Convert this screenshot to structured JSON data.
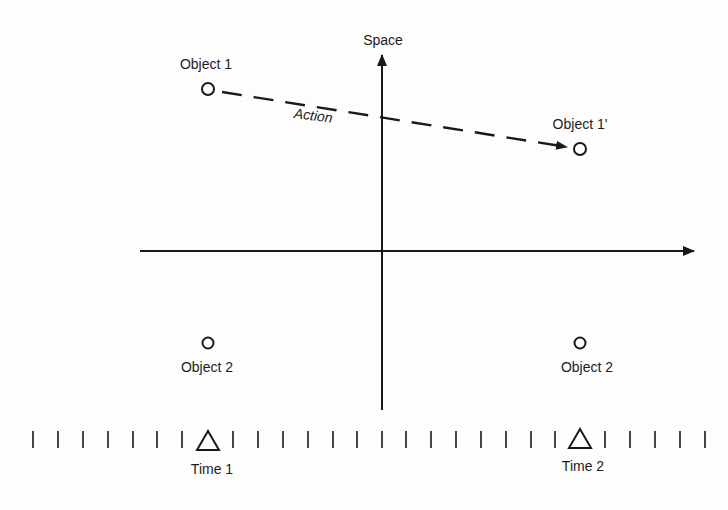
{
  "diagram": {
    "type": "space-time action diagram",
    "axes": {
      "vertical_label": "Space",
      "horizontal_label": ""
    },
    "objects": [
      {
        "id": "obj1-t1",
        "label": "Object 1",
        "time": "Time 1",
        "position": "upper-left",
        "x": 208,
        "y": 89
      },
      {
        "id": "obj1-t2",
        "label": "Object 1'",
        "time": "Time 2",
        "position": "upper-right",
        "x": 580,
        "y": 149
      },
      {
        "id": "obj2-t1",
        "label": "Object 2",
        "time": "Time 1",
        "position": "lower-left",
        "x": 208,
        "y": 343
      },
      {
        "id": "obj2-t2",
        "label": "Object 2",
        "time": "Time 2",
        "position": "lower-right",
        "x": 580,
        "y": 343
      }
    ],
    "action": {
      "label": "Action",
      "from": "Object 1",
      "to": "Object 1'",
      "style": "dashed-arrow"
    },
    "timeline": {
      "ticks_count": 27,
      "markers": [
        {
          "label": "Time 1",
          "symbol": "triangle",
          "x": 208
        },
        {
          "label": "Time 2",
          "symbol": "triangle",
          "x": 580
        }
      ]
    }
  },
  "labels": {
    "space": "Space",
    "object1_time1": "Object 1",
    "object1_time2": "Object 1'",
    "object2_time1": "Object 2",
    "object2_time2": "Object 2",
    "action": "Action",
    "time1": "Time 1",
    "time2": "Time 2"
  },
  "colors": {
    "ink": "#1a1a1a",
    "background": "#fdfdfd"
  }
}
